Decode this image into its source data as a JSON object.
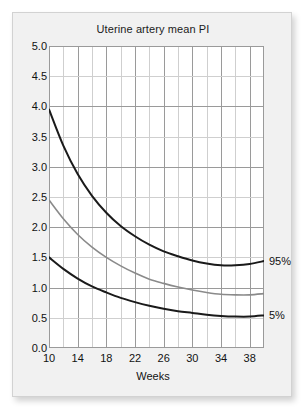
{
  "chart_data": {
    "type": "line",
    "title": "Uterine artery mean PI",
    "xlabel": "Weeks",
    "ylabel": "",
    "xlim": [
      10,
      40
    ],
    "ylim": [
      0.0,
      5.0
    ],
    "xticks": [
      10,
      14,
      18,
      22,
      26,
      30,
      34,
      38
    ],
    "yticks": [
      "0.0",
      "0.5",
      "1.0",
      "1.5",
      "2.0",
      "2.5",
      "3.0",
      "3.5",
      "4.0",
      "4.5",
      "5.0"
    ],
    "xtick_labels": [
      "10",
      "14",
      "18",
      "22",
      "26",
      "30",
      "34",
      "38"
    ],
    "x_minor_step": 2,
    "y_minor_step": 0.5,
    "grid": true,
    "legend_position": "right-inline",
    "x": [
      10,
      12,
      14,
      16,
      18,
      20,
      22,
      24,
      26,
      28,
      30,
      32,
      34,
      36,
      38,
      40
    ],
    "series": [
      {
        "name": "95%",
        "label": "95%",
        "color": "#1a1a1a",
        "width": 2.0,
        "values": [
          3.95,
          3.35,
          2.88,
          2.52,
          2.24,
          2.02,
          1.85,
          1.71,
          1.6,
          1.52,
          1.45,
          1.4,
          1.37,
          1.37,
          1.39,
          1.44
        ]
      },
      {
        "name": "50%",
        "label": "",
        "color": "#8a8a8a",
        "width": 1.6,
        "values": [
          2.45,
          2.14,
          1.88,
          1.67,
          1.5,
          1.36,
          1.24,
          1.14,
          1.07,
          1.01,
          0.96,
          0.92,
          0.89,
          0.88,
          0.88,
          0.9
        ]
      },
      {
        "name": "5%",
        "label": "5%",
        "color": "#1a1a1a",
        "width": 2.0,
        "values": [
          1.5,
          1.31,
          1.15,
          1.02,
          0.92,
          0.83,
          0.76,
          0.7,
          0.65,
          0.61,
          0.58,
          0.55,
          0.53,
          0.52,
          0.52,
          0.54
        ]
      }
    ]
  },
  "colors": {
    "card_background": "#f1f1f1",
    "plot_background": "#ffffff",
    "grid_major": "#9a9a9a",
    "grid_minor": "#cfcfcf",
    "text": "#111111",
    "curve_dark": "#1a1a1a",
    "curve_gray": "#8a8a8a"
  }
}
